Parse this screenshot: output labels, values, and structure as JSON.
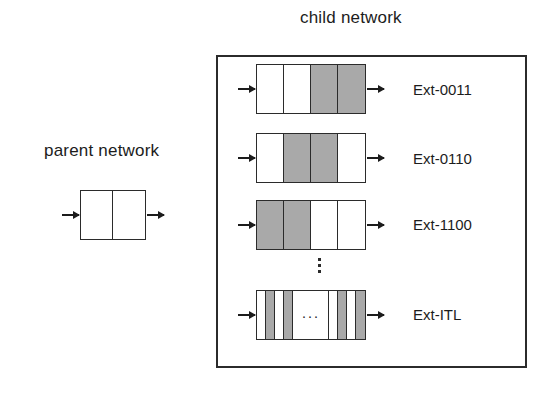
{
  "diagram": {
    "parent": {
      "title": "parent network",
      "cells": [
        "white",
        "white"
      ],
      "arrow_in": "arrow-right-icon",
      "arrow_out": "arrow-right-icon"
    },
    "child": {
      "title": "child network",
      "vertical_ellipsis": "⋮",
      "rows": [
        {
          "label": "Ext-0011",
          "type": "wide",
          "cells": [
            "white",
            "white",
            "gray",
            "gray"
          ],
          "bits": "0011"
        },
        {
          "label": "Ext-0110",
          "type": "wide",
          "cells": [
            "white",
            "gray",
            "gray",
            "white"
          ],
          "bits": "0110"
        },
        {
          "label": "Ext-1100",
          "type": "wide",
          "cells": [
            "gray",
            "gray",
            "white",
            "white"
          ],
          "bits": "1100"
        },
        {
          "label": "Ext-ITL",
          "type": "itl",
          "cells": [
            "white",
            "gray",
            "white",
            "gray",
            "gap",
            "white",
            "gray",
            "white",
            "gray"
          ],
          "gap_symbol": "···"
        }
      ]
    },
    "colors": {
      "gray_fill": "#a9a9a9",
      "white_fill": "#ffffff",
      "stroke": "#2b2b2b",
      "text": "#1c1c1c",
      "background": "#ffffff"
    }
  }
}
